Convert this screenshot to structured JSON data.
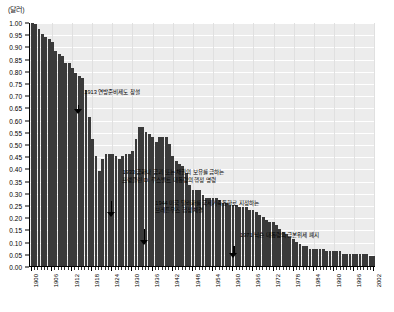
{
  "unit_label": "(달러)",
  "chart_data": {
    "type": "bar",
    "title": "",
    "subtitle": "",
    "xlabel": "",
    "ylabel": "(달러)",
    "ylim": [
      0.0,
      1.0
    ],
    "xlim": [
      1900,
      2002
    ],
    "grid": true,
    "legend_position": "none",
    "y_ticks": [
      "0.00",
      "0.05",
      "0.10",
      "0.15",
      "0.20",
      "0.25",
      "0.30",
      "0.35",
      "0.40",
      "0.45",
      "0.50",
      "0.55",
      "0.60",
      "0.65",
      "0.70",
      "0.75",
      "0.80",
      "0.85",
      "0.90",
      "0.95",
      "1.00"
    ],
    "y_tick_values": [
      0.0,
      0.05,
      0.1,
      0.15,
      0.2,
      0.25,
      0.3,
      0.35,
      0.4,
      0.45,
      0.5,
      0.55,
      0.6,
      0.65,
      0.7,
      0.75,
      0.8,
      0.85,
      0.9,
      0.95,
      1.0
    ],
    "x_tick_labels": [
      "1900",
      "1906",
      "1912",
      "1918",
      "1924",
      "1930",
      "1936",
      "1942",
      "1948",
      "1954",
      "1960",
      "1966",
      "1972",
      "1978",
      "1984",
      "1990",
      "1996",
      "2002"
    ],
    "x_tick_years": [
      1900,
      1906,
      1912,
      1918,
      1924,
      1930,
      1936,
      1942,
      1948,
      1954,
      1960,
      1966,
      1972,
      1978,
      1984,
      1990,
      1996,
      2002
    ],
    "categories": [
      1900,
      1901,
      1902,
      1903,
      1904,
      1905,
      1906,
      1907,
      1908,
      1909,
      1910,
      1911,
      1912,
      1913,
      1914,
      1915,
      1916,
      1917,
      1918,
      1919,
      1920,
      1921,
      1922,
      1923,
      1924,
      1925,
      1926,
      1927,
      1928,
      1929,
      1930,
      1931,
      1932,
      1933,
      1934,
      1935,
      1936,
      1937,
      1938,
      1939,
      1940,
      1941,
      1942,
      1943,
      1944,
      1945,
      1946,
      1947,
      1948,
      1949,
      1950,
      1951,
      1952,
      1953,
      1954,
      1955,
      1956,
      1957,
      1958,
      1959,
      1960,
      1961,
      1962,
      1963,
      1964,
      1965,
      1966,
      1967,
      1968,
      1969,
      1970,
      1971,
      1972,
      1973,
      1974,
      1975,
      1976,
      1977,
      1978,
      1979,
      1980,
      1981,
      1982,
      1983,
      1984,
      1985,
      1986,
      1987,
      1988,
      1989,
      1990,
      1991,
      1992,
      1993,
      1994,
      1995,
      1996,
      1997,
      1998,
      1999,
      2000,
      2001,
      2002
    ],
    "values": [
      1.0,
      0.99,
      0.97,
      0.95,
      0.94,
      0.93,
      0.92,
      0.88,
      0.87,
      0.86,
      0.83,
      0.83,
      0.81,
      0.79,
      0.78,
      0.77,
      0.72,
      0.61,
      0.52,
      0.45,
      0.39,
      0.44,
      0.46,
      0.46,
      0.46,
      0.45,
      0.44,
      0.45,
      0.46,
      0.46,
      0.47,
      0.52,
      0.57,
      0.57,
      0.55,
      0.54,
      0.53,
      0.51,
      0.53,
      0.53,
      0.53,
      0.5,
      0.45,
      0.43,
      0.42,
      0.41,
      0.38,
      0.33,
      0.31,
      0.31,
      0.31,
      0.29,
      0.28,
      0.28,
      0.28,
      0.28,
      0.27,
      0.26,
      0.26,
      0.25,
      0.25,
      0.25,
      0.24,
      0.24,
      0.24,
      0.23,
      0.23,
      0.22,
      0.21,
      0.2,
      0.19,
      0.18,
      0.18,
      0.17,
      0.15,
      0.14,
      0.13,
      0.12,
      0.11,
      0.1,
      0.09,
      0.08,
      0.08,
      0.07,
      0.07,
      0.07,
      0.07,
      0.07,
      0.06,
      0.06,
      0.06,
      0.06,
      0.06,
      0.05,
      0.05,
      0.05,
      0.05,
      0.05,
      0.05,
      0.05,
      0.05,
      0.04,
      0.04
    ],
    "annotations": [
      {
        "id": "annot-1913",
        "year": 1913,
        "lines": [
          "1913  연방준비제도 창설"
        ],
        "text_x_pct": 16.0,
        "text_y_pct": 27.0,
        "arrow_x_pct": 12.9,
        "arrow_y_pct": 33.5,
        "arrow_len": 9
      },
      {
        "id": "annot-1933",
        "year": 1933,
        "lines": [
          "1933  금화나 금괴 또는 채권의 보유를 금하는",
          "프랭클린 D. 루스벨트 대통령의 행정 명령"
        ],
        "text_x_pct": 27.0,
        "text_y_pct": 60.0,
        "arrow_x_pct": 22.5,
        "arrow_y_pct": 73.0,
        "arrow_len": 16
      },
      {
        "id": "annot-1944",
        "year": 1944,
        "lines": [
          "1944  미국 달러화를 국제기축통화로 지정하는",
          "브레튼우즈 협정 체결"
        ],
        "text_x_pct": 36.5,
        "text_y_pct": 72.5,
        "arrow_x_pct": 32.0,
        "arrow_y_pct": 84.5,
        "arrow_len": 16
      },
      {
        "id": "annot-1971",
        "year": 1971,
        "lines": [
          "1971  닉슨 대통령의 금본위제 폐지"
        ],
        "text_x_pct": 61.0,
        "text_y_pct": 85.5,
        "arrow_x_pct": 57.8,
        "arrow_y_pct": 91.5,
        "arrow_len": 12
      }
    ],
    "colors": {
      "bar": "#3a3a3a",
      "plot_background": "#ececec",
      "gridline": "#ffffff",
      "axis": "#000000",
      "text": "#000000"
    }
  }
}
